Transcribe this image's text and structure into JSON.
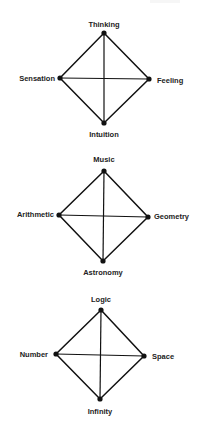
{
  "colors": {
    "background": "#ffffff",
    "ink": "#111111",
    "label": "#222222"
  },
  "diagrams": [
    {
      "top": {
        "label": "Thinking",
        "x": 104,
        "y": 33
      },
      "left": {
        "label": "Sensation",
        "x": 60,
        "y": 78
      },
      "right": {
        "label": "Feeling",
        "x": 149,
        "y": 79
      },
      "bottom": {
        "label": "Intuition",
        "x": 104,
        "y": 123
      }
    },
    {
      "top": {
        "label": "Music",
        "x": 104,
        "y": 171
      },
      "left": {
        "label": "Arithmetic",
        "x": 59,
        "y": 215
      },
      "right": {
        "label": "Geometry",
        "x": 148,
        "y": 217
      },
      "bottom": {
        "label": "Astronomy",
        "x": 103,
        "y": 261
      }
    },
    {
      "top": {
        "label": "Logic",
        "x": 101,
        "y": 310
      },
      "left": {
        "label": "Number",
        "x": 56,
        "y": 354
      },
      "right": {
        "label": "Space",
        "x": 144,
        "y": 356
      },
      "bottom": {
        "label": "Infinity",
        "x": 100,
        "y": 399
      }
    }
  ]
}
